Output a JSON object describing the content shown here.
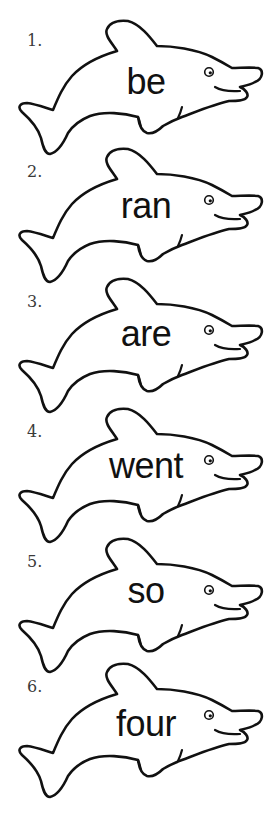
{
  "worksheet": {
    "items": [
      {
        "number": "1.",
        "word": "be"
      },
      {
        "number": "2.",
        "word": "ran"
      },
      {
        "number": "3.",
        "word": "are"
      },
      {
        "number": "4.",
        "word": "went"
      },
      {
        "number": "5.",
        "word": "so"
      },
      {
        "number": "6.",
        "word": "four"
      }
    ],
    "icons": {
      "item_shape": "dolphin-outline-icon"
    },
    "colors": {
      "outline": "#111111",
      "number_text": "#3a3a3a",
      "word_text": "#111111",
      "background": "#ffffff"
    }
  }
}
